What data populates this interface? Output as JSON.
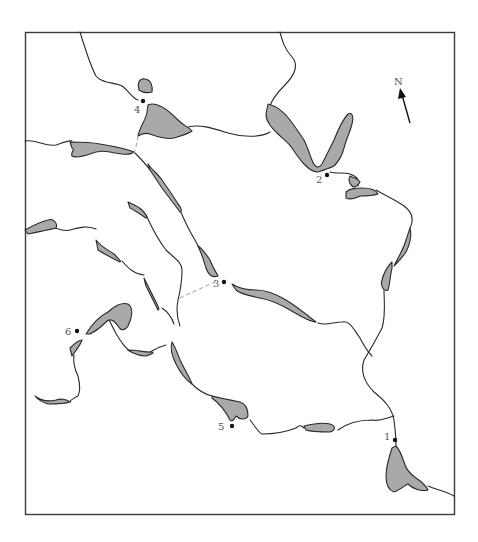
{
  "map": {
    "north_label": "N",
    "colors": {
      "lake_fill": "#a9a9a9",
      "outline": "#2a2a2a",
      "connector": "#9a9a9a",
      "label": "#555555"
    },
    "sites": [
      {
        "id": "1",
        "label": "1",
        "x": 395,
        "y": 440
      },
      {
        "id": "2",
        "label": "2",
        "x": 327,
        "y": 175
      },
      {
        "id": "3",
        "label": "3",
        "x": 224,
        "y": 282
      },
      {
        "id": "4",
        "label": "4",
        "x": 143,
        "y": 101
      },
      {
        "id": "5",
        "label": "5",
        "x": 232,
        "y": 426
      },
      {
        "id": "6",
        "label": "6",
        "x": 77,
        "y": 331
      }
    ]
  }
}
